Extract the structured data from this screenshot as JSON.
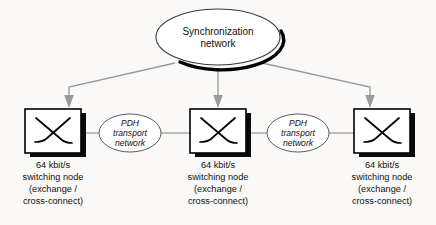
{
  "figure": {
    "type": "network-topology-diagram",
    "background_color": "#faf9f7",
    "line_color": "#8c8c8c",
    "text_color": "#111111"
  },
  "sync_cloud": {
    "name": "synchronization-network-ellipse",
    "line1": "Synchronization",
    "line2": "network",
    "has_drop_shadow": true
  },
  "transport_clouds": [
    {
      "name": "pdh-transport-network-left",
      "line1": "PDH",
      "line2": "transport",
      "line3": "network",
      "italic": true
    },
    {
      "name": "pdh-transport-network-right",
      "line1": "PDH",
      "line2": "transport",
      "line3": "network",
      "italic": true
    }
  ],
  "nodes": [
    {
      "name": "switching-node-left",
      "icon": "cross-connect-x-icon",
      "caption": [
        "64 kbit/s",
        "switching node",
        "(exchange /",
        "cross-connect)"
      ]
    },
    {
      "name": "switching-node-middle",
      "icon": "cross-connect-x-icon",
      "caption": [
        "64 kbit/s",
        "switching node",
        "(exchange /",
        "cross-connect)"
      ]
    },
    {
      "name": "switching-node-right",
      "icon": "cross-connect-x-icon",
      "caption": [
        "64 kbit/s",
        "switching node",
        "(exchange /",
        "cross-connect)"
      ]
    }
  ],
  "arrows": [
    {
      "name": "sync-arrow-to-left-node",
      "from": "sync_cloud",
      "to": "switching-node-left"
    },
    {
      "name": "sync-arrow-to-middle-node",
      "from": "sync_cloud",
      "to": "switching-node-middle"
    },
    {
      "name": "sync-arrow-to-right-node",
      "from": "sync_cloud",
      "to": "switching-node-right"
    }
  ],
  "connections": [
    {
      "name": "link-left-node-to-pdh-left"
    },
    {
      "name": "link-pdh-left-to-middle-node"
    },
    {
      "name": "link-middle-node-to-pdh-right"
    },
    {
      "name": "link-pdh-right-to-right-node"
    }
  ]
}
